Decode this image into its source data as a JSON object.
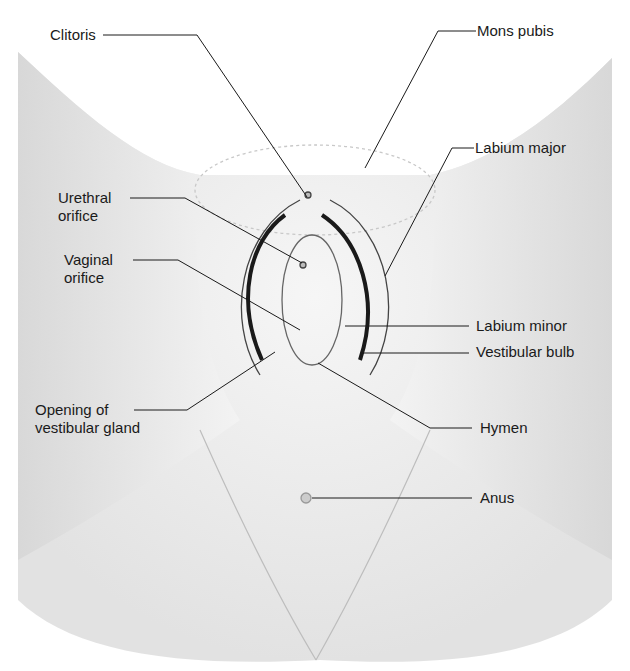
{
  "figure": {
    "colors": {
      "background": "#ffffff",
      "skin_light": "#f2f2f2",
      "skin_shade": "#d9d9d9",
      "outline": "#1a1a1a",
      "label_text": "#1a1a1a",
      "leader_line": "#1a1a1a"
    }
  },
  "labels": {
    "clitoris": {
      "text": "Clitoris"
    },
    "mons_pubis": {
      "text": "Mons pubis"
    },
    "labium_major": {
      "text": "Labium  major"
    },
    "urethral_orifice": {
      "line1": "Urethral",
      "line2": "orifice"
    },
    "vaginal_orifice": {
      "line1": "Vaginal",
      "line2": "orifice"
    },
    "labium_minor": {
      "text": "Labium  minor"
    },
    "vestibular_bulb": {
      "text": "Vestibular bulb"
    },
    "opening_vestibular_gland": {
      "line1": "Opening of",
      "line2": "vestibular gland"
    },
    "hymen": {
      "text": "Hymen"
    },
    "anus": {
      "text": "Anus"
    }
  }
}
